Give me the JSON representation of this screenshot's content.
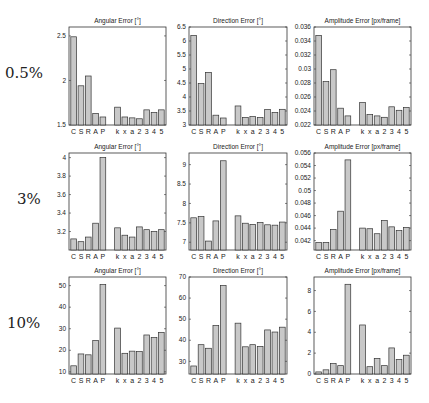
{
  "row_labels": [
    "0.5%",
    "3%",
    "10%"
  ],
  "categories": [
    "C",
    "S",
    "R",
    "A",
    "P",
    "",
    "k",
    "x",
    "a",
    "2",
    "3",
    "4",
    "5"
  ],
  "chart_data": [
    {
      "type": "bar",
      "title": "Angular Error [°]",
      "row": "0.5%",
      "ylim": [
        1.5,
        2.6
      ],
      "yticks": [
        1.5,
        2,
        2.5
      ],
      "categories": [
        "C",
        "S",
        "R",
        "A",
        "P",
        "k",
        "x",
        "a",
        "2",
        "3",
        "4",
        "5"
      ],
      "values": [
        2.49,
        1.94,
        2.05,
        1.63,
        1.59,
        1.7,
        1.59,
        1.58,
        1.57,
        1.67,
        1.64,
        1.67
      ]
    },
    {
      "type": "bar",
      "title": "Direction Error [°]",
      "row": "0.5%",
      "ylim": [
        3,
        6.5
      ],
      "yticks": [
        3,
        3.5,
        4,
        4.5,
        5,
        5.5,
        6,
        6.5
      ],
      "categories": [
        "C",
        "S",
        "R",
        "A",
        "P",
        "k",
        "x",
        "a",
        "2",
        "3",
        "4",
        "5"
      ],
      "values": [
        6.2,
        4.48,
        4.88,
        3.35,
        3.25,
        3.68,
        3.27,
        3.3,
        3.27,
        3.55,
        3.45,
        3.56
      ]
    },
    {
      "type": "bar",
      "title": "Amplitude Error [px/frame]",
      "row": "0.5%",
      "ylim": [
        0.022,
        0.036
      ],
      "yticks": [
        0.022,
        0.024,
        0.026,
        0.028,
        0.03,
        0.032,
        0.034,
        0.036
      ],
      "categories": [
        "C",
        "S",
        "R",
        "A",
        "P",
        "k",
        "x",
        "a",
        "2",
        "3",
        "4",
        "5"
      ],
      "values": [
        0.0348,
        0.0282,
        0.0299,
        0.0244,
        0.0233,
        0.0252,
        0.0235,
        0.0233,
        0.0231,
        0.0246,
        0.0241,
        0.0245
      ]
    },
    {
      "type": "bar",
      "title": "Angular Error [°]",
      "row": "3%",
      "ylim": [
        3.0,
        4.05
      ],
      "yticks": [
        3.2,
        3.4,
        3.6,
        3.8,
        4
      ],
      "categories": [
        "C",
        "S",
        "R",
        "A",
        "P",
        "k",
        "x",
        "a",
        "2",
        "3",
        "4",
        "5"
      ],
      "values": [
        3.12,
        3.09,
        3.14,
        3.29,
        4.0,
        3.24,
        3.16,
        3.14,
        3.25,
        3.22,
        3.2,
        3.22
      ]
    },
    {
      "type": "bar",
      "title": "Direction Error [°]",
      "row": "3%",
      "ylim": [
        6.8,
        9.3
      ],
      "yticks": [
        7,
        7.5,
        8,
        8.5,
        9
      ],
      "categories": [
        "C",
        "S",
        "R",
        "A",
        "P",
        "k",
        "x",
        "a",
        "2",
        "3",
        "4",
        "5"
      ],
      "values": [
        7.63,
        7.66,
        7.03,
        7.55,
        9.1,
        7.68,
        7.49,
        7.46,
        7.51,
        7.45,
        7.44,
        7.52
      ]
    },
    {
      "type": "bar",
      "title": "Amplitude Error [px/frame]",
      "row": "3%",
      "ylim": [
        0.0405,
        0.056
      ],
      "yticks": [
        0.042,
        0.044,
        0.046,
        0.048,
        0.05,
        0.052,
        0.054,
        0.056
      ],
      "categories": [
        "C",
        "S",
        "R",
        "A",
        "P",
        "k",
        "x",
        "a",
        "2",
        "3",
        "4",
        "5"
      ],
      "values": [
        0.0417,
        0.0417,
        0.0438,
        0.0467,
        0.0549,
        0.044,
        0.0439,
        0.0431,
        0.0452,
        0.0442,
        0.0436,
        0.0441
      ]
    },
    {
      "type": "bar",
      "title": "Angular Error [°]",
      "row": "10%",
      "ylim": [
        9,
        54
      ],
      "yticks": [
        10,
        20,
        30,
        40,
        50
      ],
      "categories": [
        "C",
        "S",
        "R",
        "A",
        "P",
        "k",
        "x",
        "a",
        "2",
        "3",
        "4",
        "5"
      ],
      "values": [
        12.8,
        18.3,
        17.9,
        24.5,
        50.5,
        30.3,
        18.6,
        19.6,
        19.4,
        27.1,
        25.9,
        28.3
      ]
    },
    {
      "type": "bar",
      "title": "Direction Error [°]",
      "row": "10%",
      "ylim": [
        24,
        70
      ],
      "yticks": [
        30,
        40,
        50,
        60,
        70
      ],
      "categories": [
        "C",
        "S",
        "R",
        "A",
        "P",
        "k",
        "x",
        "a",
        "2",
        "3",
        "4",
        "5"
      ],
      "values": [
        27.8,
        37.9,
        36.2,
        47.0,
        66.0,
        48.1,
        36.9,
        37.9,
        37.1,
        44.9,
        43.9,
        46.2
      ]
    },
    {
      "type": "bar",
      "title": "Amplitude Error [px/frame]",
      "row": "10%",
      "ylim": [
        0,
        9.3
      ],
      "yticks": [
        0,
        2,
        4,
        6,
        8
      ],
      "categories": [
        "C",
        "S",
        "R",
        "A",
        "P",
        "k",
        "x",
        "a",
        "2",
        "3",
        "4",
        "5"
      ],
      "values": [
        0.2,
        0.4,
        1.0,
        0.8,
        8.6,
        4.7,
        0.7,
        1.5,
        0.8,
        2.5,
        1.4,
        1.8
      ]
    }
  ]
}
